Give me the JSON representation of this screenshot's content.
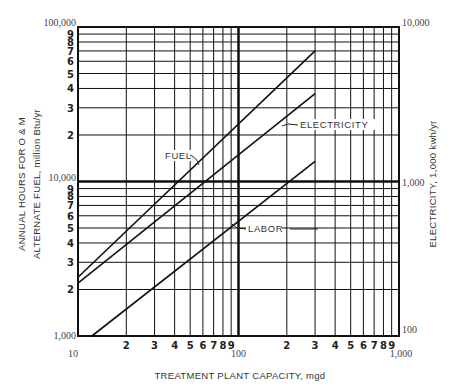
{
  "chart_data": {
    "type": "line",
    "scale": "log-log",
    "title": "",
    "xlabel": "TREATMENT PLANT CAPACITY, mgd",
    "ylabel_left_line1": "ANNUAL HOURS FOR O & M",
    "ylabel_left_line2": "ALTERNATE FUEL, million Btu/yr",
    "ylabel_right": "ELECTRICITY, 1,000 kwh/yr",
    "xlim": [
      10,
      1000
    ],
    "ylim_left": [
      1000,
      100000
    ],
    "ylim_right": [
      100,
      10000
    ],
    "x_decade_labels": [
      "10",
      "100",
      "1,000"
    ],
    "x_minor_labels": [
      "2",
      "3",
      "4",
      "5",
      "6",
      "7",
      "8",
      "9"
    ],
    "y_left_decade_labels": [
      "1,000",
      "10,000",
      "100,000"
    ],
    "y_right_decade_labels": [
      "100",
      "1,000",
      "10,000"
    ],
    "y_minor_labels": [
      "2",
      "3",
      "4",
      "5",
      "6",
      "7",
      "8",
      "9"
    ],
    "grid": true,
    "legend": "inline labels",
    "series": [
      {
        "name": "FUEL",
        "x": [
          10,
          300
        ],
        "y": [
          2400,
          70000
        ]
      },
      {
        "name": "ELECTRICITY",
        "x": [
          10,
          300
        ],
        "y": [
          2200,
          37000
        ]
      },
      {
        "name": "LABOR",
        "x": [
          12.2,
          300
        ],
        "y": [
          1000,
          13500
        ]
      }
    ]
  }
}
